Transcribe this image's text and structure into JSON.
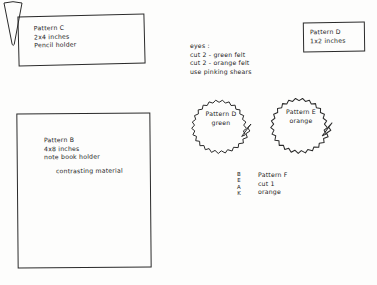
{
  "page": {
    "ink_color": "#222222",
    "paper_color": "#fdfdfc"
  },
  "pattern_c": {
    "box_label": "pattern-c-rectangle",
    "text": "Pattern C\n2x4 inches\nPencil holder"
  },
  "pattern_b": {
    "box_label": "pattern-b-rectangle",
    "text": "Pattern B\n4x8 inches\nnote book holder",
    "note": "contrasting material"
  },
  "pattern_d_rect": {
    "box_label": "pattern-d-rectangle",
    "text": "Pattern D\n1x2 inches"
  },
  "eyes": {
    "text": "eyes :\ncut 2 - green felt\ncut 2 - orange felt\nuse pinking shears"
  },
  "starburst_green": {
    "shape": "pinked-circle",
    "text": "Pattern D\ngreen",
    "color_word": "green"
  },
  "starburst_orange": {
    "shape": "pinked-circle",
    "text": "Pattern E\norange",
    "color_word": "orange"
  },
  "beak": {
    "shape": "cone-triangle",
    "vertical_text": "B\nE\nA\nK",
    "text": "Pattern F\ncut 1\norange"
  }
}
